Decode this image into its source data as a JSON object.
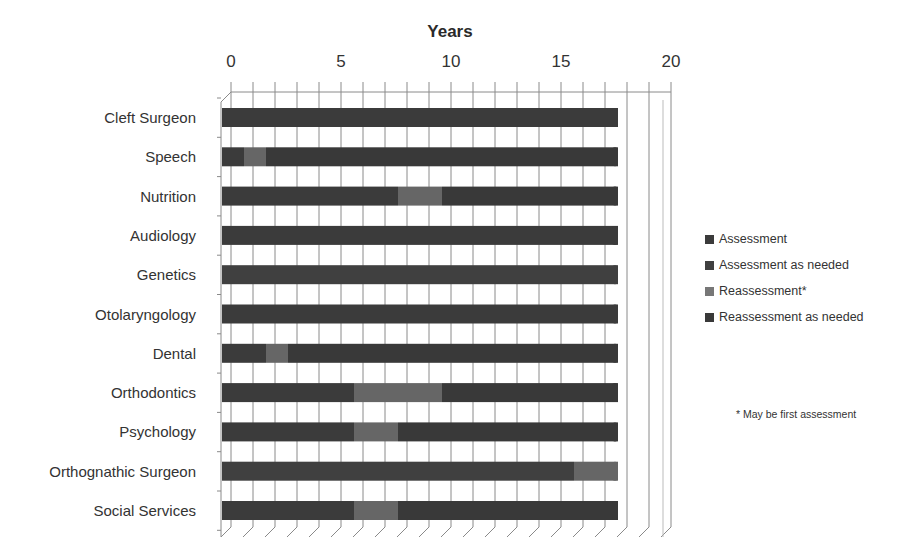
{
  "chart_data": {
    "type": "bar",
    "orientation": "horizontal-stacked-3d",
    "title": "Years",
    "xlabel": "Years",
    "ylabel": "",
    "xlim": [
      0,
      20
    ],
    "xticks": [
      "0",
      "5",
      "10",
      "15",
      "20"
    ],
    "grid": true,
    "legend_position": "right",
    "categories": [
      "Cleft Surgeon",
      "Speech",
      "Nutrition",
      "Audiology",
      "Genetics",
      "Otolaryngology",
      "Dental",
      "Orthodontics",
      "Psychology",
      "Orthognathic Surgeon",
      "Social Services"
    ],
    "segments": [
      [
        {
          "series": "Assessment",
          "from": 0,
          "to": 18
        }
      ],
      [
        {
          "series": "Assessment",
          "from": 0,
          "to": 1
        },
        {
          "series": "Reassessment*",
          "from": 1,
          "to": 2
        },
        {
          "series": "Reassessment as needed",
          "from": 2,
          "to": 18
        }
      ],
      [
        {
          "series": "Assessment",
          "from": 0,
          "to": 8
        },
        {
          "series": "Reassessment*",
          "from": 8,
          "to": 10
        },
        {
          "series": "Reassessment as needed",
          "from": 10,
          "to": 18
        }
      ],
      [
        {
          "series": "Assessment",
          "from": 0,
          "to": 18
        }
      ],
      [
        {
          "series": "Assessment as needed",
          "from": 0,
          "to": 18
        }
      ],
      [
        {
          "series": "Assessment",
          "from": 0,
          "to": 18
        }
      ],
      [
        {
          "series": "Assessment",
          "from": 0,
          "to": 2
        },
        {
          "series": "Reassessment*",
          "from": 2,
          "to": 3
        },
        {
          "series": "Reassessment as needed",
          "from": 3,
          "to": 18
        }
      ],
      [
        {
          "series": "Assessment",
          "from": 0,
          "to": 6
        },
        {
          "series": "Reassessment*",
          "from": 6,
          "to": 10
        },
        {
          "series": "Reassessment as needed",
          "from": 10,
          "to": 18
        }
      ],
      [
        {
          "series": "Assessment",
          "from": 0,
          "to": 6
        },
        {
          "series": "Reassessment*",
          "from": 6,
          "to": 8
        },
        {
          "series": "Reassessment as needed",
          "from": 8,
          "to": 18
        }
      ],
      [
        {
          "series": "Assessment as needed",
          "from": 0,
          "to": 16
        },
        {
          "series": "Reassessment*",
          "from": 16,
          "to": 18
        }
      ],
      [
        {
          "series": "Assessment",
          "from": 0,
          "to": 6
        },
        {
          "series": "Reassessment*",
          "from": 6,
          "to": 8
        },
        {
          "series": "Reassessment as needed",
          "from": 8,
          "to": 18
        }
      ]
    ],
    "series": [
      {
        "name": "Assessment",
        "color": "#3b3b3b"
      },
      {
        "name": "Assessment as needed",
        "color": "#404040"
      },
      {
        "name": "Reassessment*",
        "color": "#666666"
      },
      {
        "name": "Reassessment as needed",
        "color": "#393939"
      }
    ],
    "annotations": [
      "* May be first assessment"
    ]
  },
  "labels": {
    "title": "Years",
    "ticks": [
      "0",
      "5",
      "10",
      "15",
      "20"
    ],
    "categories": [
      "Cleft Surgeon",
      "Speech",
      "Nutrition",
      "Audiology",
      "Genetics",
      "Otolaryngology",
      "Dental",
      "Orthodontics",
      "Psychology",
      "Orthognathic Surgeon",
      "Social Services"
    ],
    "legend": [
      "Assessment",
      "Assessment as needed",
      "Reassessment*",
      "Reassessment as needed"
    ],
    "note": "* May be first assessment"
  }
}
